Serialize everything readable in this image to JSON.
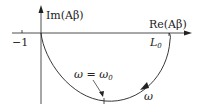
{
  "diagram": {
    "axes": {
      "x_label": "Re(Aβ)",
      "y_label": "Im(Aβ)"
    },
    "points": {
      "minus_one": "−1",
      "L0": "L",
      "L0_sub": "0"
    },
    "annotations": {
      "omega_eq": "ω = ω",
      "omega_eq_sub": "0",
      "omega": "ω"
    },
    "colors": {
      "line": "#222222",
      "background": "#ffffff"
    }
  }
}
